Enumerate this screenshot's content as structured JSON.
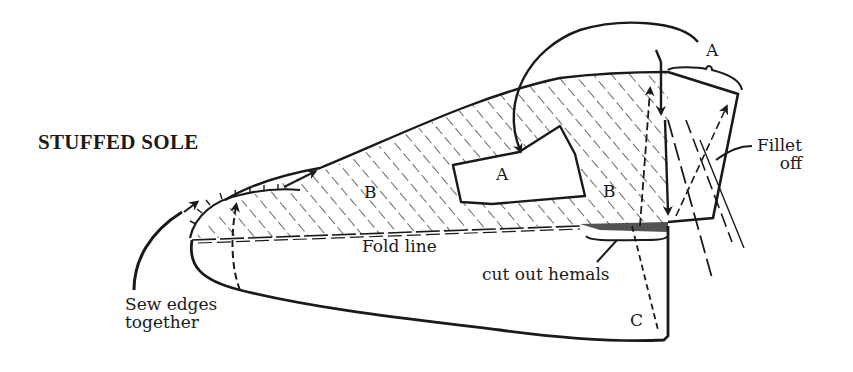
{
  "diagram": {
    "title": "STUFFED SOLE",
    "labels": {
      "sew_edges_line1": "Sew edges",
      "sew_edges_line2": "together",
      "fold_line": "Fold line",
      "cut_out_hemals": "cut out hemals",
      "fillet_line1": "Fillet",
      "fillet_line2": "off"
    },
    "regions": {
      "a_top": "A",
      "a_pocket": "A",
      "b_left": "B",
      "b_right": "B",
      "c": "C"
    },
    "colors": {
      "ink": "#1a1a1a",
      "background": "#ffffff"
    }
  }
}
